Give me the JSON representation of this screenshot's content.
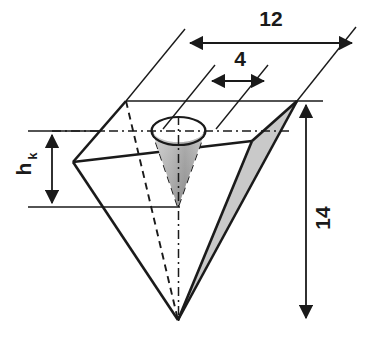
{
  "figure": {
    "background_color": "#ffffff",
    "line_color": "#1a1a1a",
    "shaded_face_color": "#c9c9c9",
    "cone_color_light": "#cfcfcf",
    "cone_color_dark": "#8a8a8a"
  },
  "dimensions": [
    {
      "id": "width-top",
      "label": "12",
      "orientation": "horizontal",
      "value": 12,
      "describes": "top edge length of the pyramid base square"
    },
    {
      "id": "bore-diameter",
      "label": "4",
      "orientation": "horizontal",
      "value": 4,
      "describes": "diameter of the conical bore opening"
    },
    {
      "id": "pyramid-height",
      "label": "14",
      "orientation": "vertical",
      "value": 14,
      "describes": "total height of the pyramid"
    },
    {
      "id": "cone-height",
      "label": "h",
      "label_subscript": "k",
      "orientation": "vertical",
      "describes": "height of the conical bore"
    }
  ],
  "annotations": {
    "centerline": "dash-dot axis through cone",
    "hidden_edges": "dashed back edges of pyramid"
  }
}
